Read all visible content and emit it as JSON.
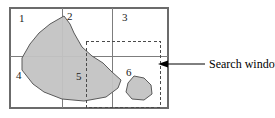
{
  "figure": {
    "name": "search-window-diagram",
    "width": 275,
    "height": 118,
    "background_color": "#ffffff"
  },
  "grid": {
    "frame": {
      "x": 10,
      "y": 8,
      "width": 158,
      "height": 100
    },
    "vertical_dividers_x": [
      62,
      112
    ],
    "horizontal_dividers_y": [
      56
    ],
    "line_color": "#7d7d7d",
    "frame_color": "#6b6b6b"
  },
  "cells": [
    {
      "id": "cell-1",
      "label": "1",
      "x": 19,
      "y": 22
    },
    {
      "id": "cell-2",
      "label": "2",
      "x": 67,
      "y": 20
    },
    {
      "id": "cell-3",
      "label": "3",
      "x": 122,
      "y": 21
    },
    {
      "id": "cell-4",
      "label": "4",
      "x": 16,
      "y": 79
    },
    {
      "id": "cell-5",
      "label": "5",
      "x": 76,
      "y": 80
    },
    {
      "id": "cell-6",
      "label": "6",
      "x": 126,
      "y": 76
    }
  ],
  "search_window": {
    "label": "Search window",
    "rect": {
      "x": 86,
      "y": 41,
      "width": 74,
      "height": 66
    },
    "stroke_color": "#4a4a4a",
    "dash_pattern": "3 2.2"
  },
  "callout": {
    "label": "Search window",
    "text_x": 209,
    "text_y": 68,
    "leader_from_x": 205,
    "leader_to_x": 163,
    "leader_y": 64,
    "arrow_color": "#000000"
  },
  "shapes": [
    {
      "id": "main-region",
      "name": "large-shaded-polygon",
      "fill": "#c3c3c3",
      "stroke": "#5a5a5a",
      "points": "64,16 50,24 39,33 30,44 22,58 22,70 33,84 44,92 62,99 84,101 106,97 118,88 121,80 112,72 103,63 92,56 82,47 74,33 70,24"
    },
    {
      "id": "small-region",
      "name": "small-shaded-polygon",
      "fill": "#c3c3c3",
      "stroke": "#5a5a5a",
      "points": "134,76 128,83 126,92 132,99 144,100 152,94 151,85 144,78"
    }
  ]
}
